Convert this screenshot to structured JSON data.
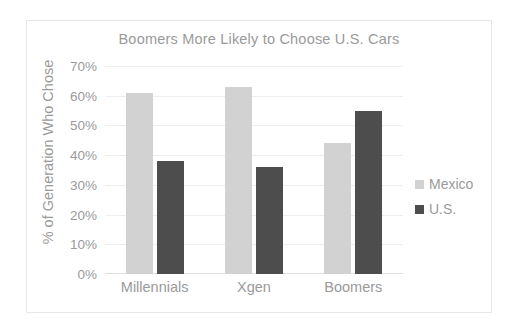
{
  "chart_data": {
    "type": "bar",
    "title": "Boomers More Likely to Choose U.S. Cars",
    "xlabel": "",
    "ylabel": "% of Generation Who Chose",
    "categories": [
      "Millennials",
      "Xgen",
      "Boomers"
    ],
    "series": [
      {
        "name": "Mexico",
        "color": "#d2d2d2",
        "values": [
          61,
          63,
          44
        ]
      },
      {
        "name": "U.S.",
        "color": "#4d4d4d",
        "values": [
          38,
          36,
          55
        ]
      }
    ],
    "ylim": [
      0,
      70
    ],
    "ytick_values": [
      70,
      60,
      50,
      40,
      30,
      20,
      10,
      0
    ],
    "ytick_labels": [
      "70%",
      "60%",
      "50%",
      "40%",
      "30%",
      "20%",
      "10%",
      "0%"
    ],
    "grid": true,
    "legend_position": "right",
    "value_suffix": "%"
  },
  "colors": {
    "background": "#ffffff",
    "frame_border": "#e8e8e8",
    "text": "#9a9a9a",
    "gridline": "#eeeeee",
    "mexico": "#d2d2d2",
    "us": "#4d4d4d"
  }
}
